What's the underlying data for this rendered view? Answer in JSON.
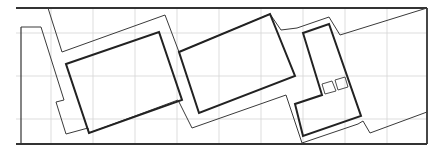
{
  "diagram": {
    "type": "architectural-site-plan",
    "width": 433,
    "height": 153,
    "colors": {
      "background": "#ffffff",
      "grid": "#d4d4d4",
      "thin_line": "#3a3a3a",
      "thick_line": "#222222",
      "frame": "#333333"
    },
    "grid": {
      "vertical_x": [
        51,
        93,
        135,
        177,
        219,
        261,
        303,
        345,
        387
      ],
      "horizontal_y": [
        33,
        76,
        119
      ],
      "y_range": [
        8,
        144
      ],
      "x_range": [
        16,
        427
      ]
    },
    "frame": {
      "top": [
        [
          16,
          8
        ],
        [
          427,
          8
        ]
      ],
      "bottom": [
        [
          16,
          144
        ],
        [
          427,
          144
        ]
      ],
      "right": [
        [
          427,
          8
        ],
        [
          427,
          144
        ]
      ],
      "left_marker": [
        [
          21,
          27
        ],
        [
          21,
          144
        ]
      ]
    },
    "outlines": [
      {
        "name": "site-boundary-upper",
        "points": [
          [
            48,
            8
          ],
          [
            62,
            52
          ],
          [
            165,
            15
          ],
          [
            179,
            52
          ],
          [
            270,
            14
          ],
          [
            281,
            30
          ],
          [
            297,
            28
          ],
          [
            329,
            17
          ],
          [
            340,
            35
          ],
          [
            427,
            8
          ]
        ]
      },
      {
        "name": "site-boundary-lower",
        "points": [
          [
            21,
            27
          ],
          [
            41,
            27
          ],
          [
            64,
            100
          ],
          [
            56,
            102
          ],
          [
            66,
            134
          ],
          [
            88,
            128
          ],
          [
            89,
            133
          ],
          [
            178,
            100
          ],
          [
            192,
            128
          ],
          [
            286,
            95
          ],
          [
            302,
            143
          ],
          [
            358,
            124
          ],
          [
            363,
            121
          ],
          [
            370,
            133
          ],
          [
            427,
            112
          ]
        ]
      }
    ],
    "buildings": [
      {
        "name": "building-left",
        "points": [
          [
            66,
            64
          ],
          [
            159,
            32
          ],
          [
            182,
            100
          ],
          [
            89,
            133
          ]
        ]
      },
      {
        "name": "building-middle",
        "points": [
          [
            179,
            52
          ],
          [
            270,
            14
          ],
          [
            295,
            76
          ],
          [
            199,
            113
          ]
        ]
      },
      {
        "name": "building-right-l",
        "points": [
          [
            303,
            33
          ],
          [
            329,
            24
          ],
          [
            361,
            116
          ],
          [
            303,
            136
          ],
          [
            295,
            104
          ],
          [
            322,
            95
          ]
        ]
      }
    ],
    "small_squares": [
      {
        "name": "square-1",
        "points": [
          [
            322,
            84
          ],
          [
            332,
            81
          ],
          [
            336,
            91
          ],
          [
            325,
            94
          ]
        ]
      },
      {
        "name": "square-2",
        "points": [
          [
            335,
            80
          ],
          [
            345,
            77
          ],
          [
            348,
            87
          ],
          [
            338,
            90
          ]
        ]
      }
    ]
  }
}
